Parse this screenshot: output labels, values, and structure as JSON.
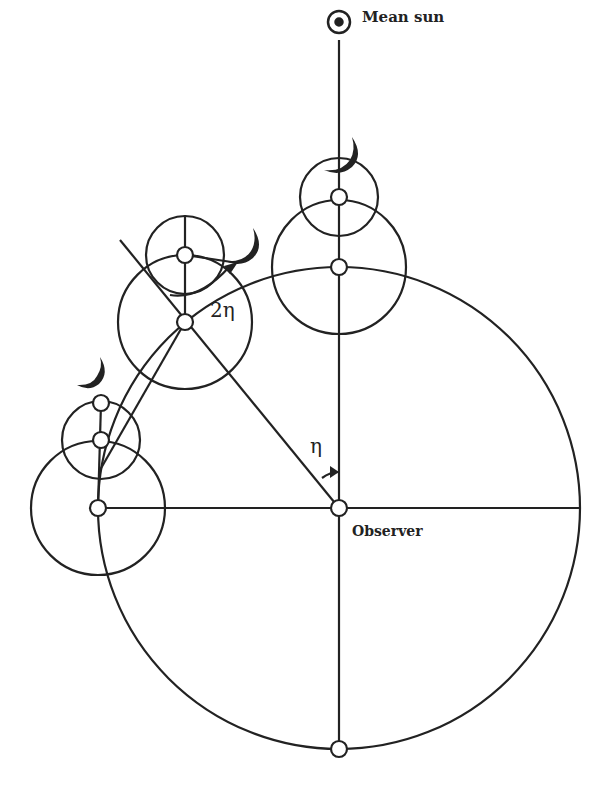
{
  "diagram": {
    "labels": {
      "mean_sun": "Mean sun",
      "observer": "Observer",
      "angle_eta": "η",
      "angle_two_eta": "2η"
    },
    "icons": {
      "sun_symbol": "circled-dot",
      "moon_symbol": "crescent-moon"
    },
    "colors": {
      "stroke": "#222222",
      "background": "#ffffff"
    },
    "elements": {
      "observer": {
        "x": 339,
        "y": 508
      },
      "deferent_radius": 241,
      "epicycle_positions": [
        {
          "name": "top",
          "center": [
            339,
            267
          ],
          "epicycle_center": [
            339,
            197
          ],
          "moon": [
            339,
            160
          ]
        },
        {
          "name": "upper-left",
          "center": [
            185,
            322
          ],
          "epicycle_center": [
            185,
            255
          ],
          "moon": [
            238,
            268
          ]
        },
        {
          "name": "left",
          "center": [
            98,
            508
          ],
          "epicycle_center": [
            101,
            440
          ],
          "moon": [
            101,
            403
          ]
        }
      ]
    }
  }
}
